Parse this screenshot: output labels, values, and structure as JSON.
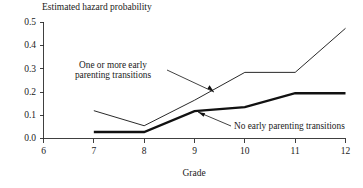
{
  "figure": {
    "width": 363,
    "height": 188,
    "background": "#ffffff",
    "ink_color": "#111111"
  },
  "chart_data": {
    "type": "line",
    "title": "",
    "subtitle": "",
    "xlabel": "Grade",
    "ylabel": "Estimated hazard probability",
    "xlim": [
      6,
      12
    ],
    "ylim": [
      0.0,
      0.5
    ],
    "xticks": [
      6,
      7,
      8,
      9,
      10,
      11,
      12
    ],
    "xtick_labels": [
      "6",
      "7",
      "8",
      "9",
      "10",
      "11",
      "12"
    ],
    "yticks": [
      0.0,
      0.1,
      0.2,
      0.3,
      0.4,
      0.5
    ],
    "ytick_labels": [
      "0.0",
      "0.1",
      "0.2",
      "0.3",
      "0.4",
      "0.5"
    ],
    "grid": false,
    "legend": "annotations",
    "x": [
      7,
      8,
      9,
      10,
      11,
      12
    ],
    "series": [
      {
        "name": "One or more early parenting transitions",
        "style": "thin",
        "values": [
          0.12,
          0.055,
          0.165,
          0.285,
          0.285,
          0.475
        ]
      },
      {
        "name": "No early parenting transitions",
        "style": "thick",
        "values": [
          0.028,
          0.028,
          0.118,
          0.135,
          0.195,
          0.195
        ]
      }
    ],
    "annotations": [
      {
        "id": "one-or-more",
        "line1": "One or more early",
        "line2": "parenting transitions",
        "points_to_x": 9.35,
        "points_to_y": 0.215
      },
      {
        "id": "no-early",
        "line1": "No early parenting transitions",
        "line2": "",
        "points_to_x": 9.1,
        "points_to_y": 0.118
      }
    ]
  }
}
